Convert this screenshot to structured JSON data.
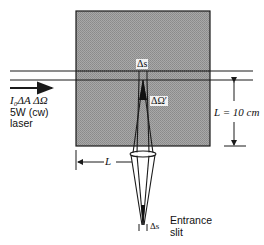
{
  "diagram": {
    "type": "optical setup - laser scattering into spectrometer entrance slit",
    "colors": {
      "sample_fill": "#9a9a9a",
      "stroke": "#1a1a1a",
      "background": "#ffffff"
    },
    "labels": {
      "beam_intensity": "I₀ΔA ΔΩ",
      "laser_power": "5W (cw)",
      "laser": "laser",
      "scatter_length": "Δs",
      "solid_angle": "ΔΩ′",
      "distance_L_right": "L = 10 cm",
      "distance_L_left": "L",
      "slit_width": "Δs",
      "entrance": "Entrance",
      "slit": "slit"
    },
    "elements": [
      {
        "id": "sample-volume",
        "shape": "square",
        "fill": "gray halftone"
      },
      {
        "id": "laser-beam",
        "shape": "two horizontal parallel lines",
        "direction": "left-to-right"
      },
      {
        "id": "scattering-cone",
        "shape": "converging cone from Δs through lens"
      },
      {
        "id": "lens",
        "shape": "ellipse"
      },
      {
        "id": "entrance-slit",
        "shape": "two short vertical marks"
      },
      {
        "id": "dimension-L-vertical",
        "value": "10 cm"
      },
      {
        "id": "dimension-L-horizontal"
      }
    ]
  }
}
